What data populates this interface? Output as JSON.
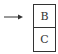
{
  "diagram": {
    "arrow": {
      "direction": "right",
      "color": "#333333"
    },
    "stack": {
      "cells": [
        {
          "label": "B"
        },
        {
          "label": "C"
        }
      ],
      "border_color": "#333333"
    }
  }
}
